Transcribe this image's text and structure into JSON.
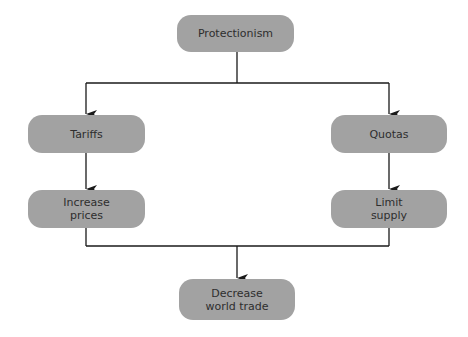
{
  "diagram": {
    "type": "flowchart",
    "colors": {
      "node_fill": "#a2a2a2",
      "node_text": "#2e2e2e",
      "edge": "#1a1a1a",
      "background": "#ffffff"
    },
    "nodes": {
      "protectionism": "Protectionism",
      "tariffs": "Tariffs",
      "quotas": "Quotas",
      "increase_prices": "Increase\nprices",
      "limit_supply": "Limit\nsupply",
      "decrease_world_trade": "Decrease\nworld trade"
    },
    "edges": [
      {
        "from": "Protectionism",
        "to": "Tariffs"
      },
      {
        "from": "Protectionism",
        "to": "Quotas"
      },
      {
        "from": "Tariffs",
        "to": "Increase prices"
      },
      {
        "from": "Quotas",
        "to": "Limit supply"
      },
      {
        "from": "Increase prices",
        "to": "Decrease world trade"
      },
      {
        "from": "Limit supply",
        "to": "Decrease world trade"
      }
    ]
  }
}
